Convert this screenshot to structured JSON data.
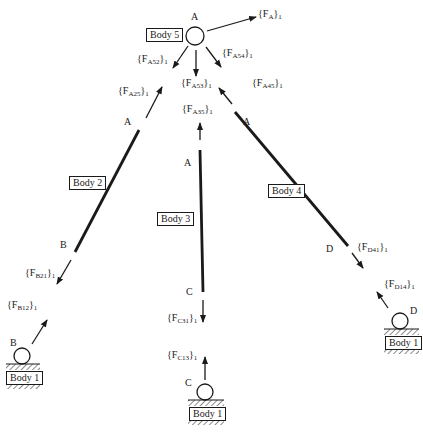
{
  "diagram": {
    "bodies": {
      "body5": "Body 5",
      "body2": "Body 2",
      "body3": "Body 3",
      "body4": "Body 4",
      "body1_b": "Body 1",
      "body1_c": "Body 1",
      "body1_d": "Body 1"
    },
    "points": {
      "a_top": "A",
      "a_body2": "A",
      "a_body3": "A",
      "a_body4": "A",
      "b_body2": "B",
      "b_ground": "B",
      "c_body3": "C",
      "c_ground": "C",
      "d_body4": "D",
      "d_ground": "D"
    },
    "forces": {
      "FA": {
        "main": "{F",
        "sub": "A",
        "tail": "}",
        "frame": "1"
      },
      "FA52": {
        "main": "{F",
        "sub": "A52",
        "tail": "}",
        "frame": "1"
      },
      "FA53": {
        "main": "{F",
        "sub": "A53",
        "tail": "}",
        "frame": "1"
      },
      "FA54": {
        "main": "{F",
        "sub": "A54",
        "tail": "}",
        "frame": "1"
      },
      "FA25": {
        "main": "{F",
        "sub": "A25",
        "tail": "}",
        "frame": "1"
      },
      "FA35": {
        "main": "{F",
        "sub": "A35",
        "tail": "}",
        "frame": "1"
      },
      "FA45": {
        "main": "{F",
        "sub": "A45",
        "tail": "}",
        "frame": "1"
      },
      "FB21": {
        "main": "{F",
        "sub": "B21",
        "tail": "}",
        "frame": "1"
      },
      "FB12": {
        "main": "{F",
        "sub": "B12",
        "tail": "}",
        "frame": "1"
      },
      "FC31": {
        "main": "{F",
        "sub": "C31",
        "tail": "}",
        "frame": "1"
      },
      "FC13": {
        "main": "{F",
        "sub": "C13",
        "tail": "}",
        "frame": "1"
      },
      "FD41": {
        "main": "{F",
        "sub": "D41",
        "tail": "}",
        "frame": "1"
      },
      "FD14": {
        "main": "{F",
        "sub": "D14",
        "tail": "}",
        "frame": "1"
      }
    },
    "colors": {
      "ink": "#1a1a1a",
      "background": "#ffffff"
    }
  }
}
